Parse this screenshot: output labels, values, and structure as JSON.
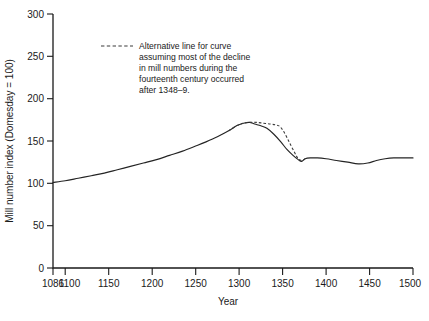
{
  "chart_data": {
    "type": "line",
    "title": "",
    "xlabel": "Year",
    "ylabel": "Mill number index (Domesday = 100)",
    "xlim": [
      1086,
      1500
    ],
    "ylim": [
      0,
      300
    ],
    "grid": false,
    "legend_position": "inside-upper-left",
    "x_ticks": [
      1086,
      1100,
      1150,
      1200,
      1250,
      1300,
      1350,
      1400,
      1450,
      1500
    ],
    "x_tick_labels": [
      "1086",
      "1100",
      "1150",
      "1200",
      "1250",
      "1300",
      "1350",
      "1400",
      "1450",
      "1500"
    ],
    "y_ticks": [
      0,
      50,
      100,
      150,
      200,
      250,
      300
    ],
    "y_tick_labels": [
      "0",
      "50",
      "100",
      "150",
      "200",
      "250",
      "300"
    ],
    "series": [
      {
        "name": "Mill number index (main curve)",
        "style": "solid",
        "x": [
          1086,
          1100,
          1115,
          1130,
          1145,
          1160,
          1175,
          1190,
          1205,
          1220,
          1235,
          1250,
          1262,
          1275,
          1288,
          1297,
          1305,
          1312,
          1318,
          1325,
          1332,
          1340,
          1348,
          1355,
          1362,
          1368,
          1372,
          1376,
          1382,
          1390,
          1400,
          1412,
          1425,
          1437,
          1448,
          1458,
          1468,
          1478,
          1490,
          1500
        ],
        "y": [
          101,
          103,
          106,
          109,
          112,
          116,
          120,
          124,
          128,
          133,
          138,
          144,
          149,
          155,
          162,
          168,
          171,
          172,
          170,
          168,
          165,
          158,
          149,
          140,
          133,
          128,
          126,
          129,
          130,
          130,
          129,
          127,
          125,
          123,
          124,
          127,
          129,
          130,
          130,
          130
        ]
      },
      {
        "name": "Alternative line",
        "style": "dashed",
        "x": [
          1288,
          1297,
          1305,
          1312,
          1320,
          1328,
          1336,
          1342,
          1347,
          1352,
          1358,
          1364,
          1368,
          1372,
          1376
        ],
        "y": [
          162,
          168,
          171,
          172,
          172,
          171,
          170,
          169,
          167,
          160,
          148,
          136,
          129,
          127,
          129
        ]
      }
    ],
    "annotations": [
      {
        "name": "alternative-line-legend",
        "marker": "dashed-line",
        "lines": [
          "Alternative line for curve",
          "assuming most of the decline",
          "in mill numbers during the",
          "fourteenth century occurred",
          "after 1348–9."
        ]
      }
    ],
    "colors": {
      "solid_line": "#242424",
      "dashed_line": "#3a3a3a",
      "axis": "#1a1a1a",
      "background": "#ffffff"
    }
  }
}
